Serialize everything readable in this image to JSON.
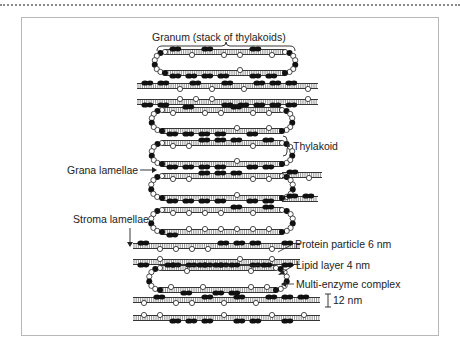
{
  "diagram": {
    "title": "Granum (stack of thylakoids)",
    "labels": {
      "granum": "Granum (stack of thylakoids)",
      "thylakoid": "Thylakoid",
      "grana_lamellae": "Grana lamellae",
      "stroma_lamellae": "Stroma lamellae",
      "protein_particle": "Protein particle 6 nm",
      "lipid_layer": "Lipid layer 4 nm",
      "multi_enzyme": "Multi-enzyme complex",
      "spacing": "12 nm"
    },
    "colors": {
      "ink": "#222222",
      "frame": "#b8b8b8",
      "dots": "#8a8a8a"
    }
  }
}
